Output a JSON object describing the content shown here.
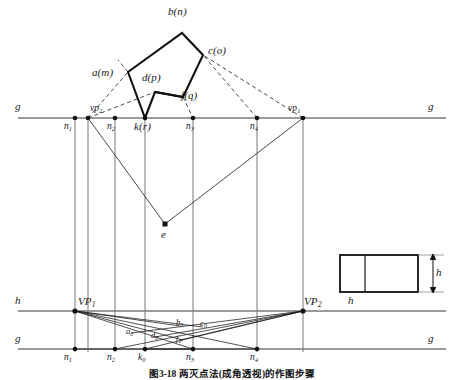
{
  "figure": {
    "type": "two-point-perspective-construction",
    "caption": "图3-18  两灭点法(成角透视)的作图步骤",
    "colors": {
      "stroke": "#1a1a1a",
      "light_stroke": "#6e6e6e",
      "background": "#ffffff"
    }
  },
  "plan_view": {
    "title_labels": {
      "ground_line_left": "g",
      "ground_line_right": "g"
    },
    "shape_vertices": [
      {
        "id": "a",
        "label": "a(m)",
        "x": 128,
        "y": 72
      },
      {
        "id": "b",
        "label": "b(n)",
        "x": 182,
        "y": 33
      },
      {
        "id": "c",
        "label": "c(o)",
        "x": 203,
        "y": 55
      },
      {
        "id": "f",
        "label": "f(q)",
        "x": 183,
        "y": 97
      },
      {
        "id": "d",
        "label": "d(p)",
        "x": 155,
        "y": 92
      },
      {
        "id": "k",
        "label": "k(r)",
        "x": 145,
        "y": 118
      }
    ],
    "ground_points": [
      {
        "id": "n1",
        "label": "n",
        "sub": "1",
        "x": 75
      },
      {
        "id": "vp2",
        "label": "vp",
        "sub": "2",
        "x": 88
      },
      {
        "id": "n2",
        "label": "n",
        "sub": "2",
        "x": 115
      },
      {
        "id": "k",
        "label": "k(r)",
        "sub": "",
        "x": 145
      },
      {
        "id": "n3",
        "label": "n",
        "sub": "3",
        "x": 193
      },
      {
        "id": "n4",
        "label": "n",
        "sub": "4",
        "x": 257
      },
      {
        "id": "vp1",
        "label": "vp",
        "sub": "1",
        "x": 303
      }
    ],
    "eye_point": {
      "id": "e",
      "label": "e",
      "x": 165,
      "y": 224
    },
    "ground_line_y": 118
  },
  "perspective_view": {
    "horizon_label_left": "h",
    "horizon_label_right": "h",
    "ground_label_left": "g",
    "ground_label_right": "g",
    "horizon_y": 311,
    "ground_y": 349,
    "vanishing_points": [
      {
        "id": "VP1",
        "label": "VP",
        "sub": "1",
        "x": 75,
        "y": 311
      },
      {
        "id": "VP2",
        "label": "VP",
        "sub": "2",
        "x": 303,
        "y": 311
      }
    ],
    "ground_points": [
      {
        "id": "n1",
        "label": "n",
        "sub": "1",
        "x": 75
      },
      {
        "id": "n2",
        "label": "n",
        "sub": "2",
        "x": 115
      },
      {
        "id": "k0",
        "label": "k",
        "sub": "0",
        "x": 145
      },
      {
        "id": "n3",
        "label": "n",
        "sub": "3",
        "x": 193
      },
      {
        "id": "n4",
        "label": "n",
        "sub": "4",
        "x": 257
      }
    ],
    "projected_points": [
      {
        "id": "a0",
        "label": "a",
        "sub": "0",
        "x": 131,
        "y": 333
      },
      {
        "id": "d0",
        "label": "d",
        "sub": "0",
        "x": 155,
        "y": 337
      },
      {
        "id": "b0",
        "label": "b",
        "sub": "0",
        "x": 180,
        "y": 326
      },
      {
        "id": "c0",
        "label": "c",
        "sub": "0",
        "x": 203,
        "y": 327
      },
      {
        "id": "f0",
        "label": "f",
        "sub": "0",
        "x": 180,
        "y": 340
      }
    ]
  },
  "elevation_inset": {
    "height_label": "h",
    "rect": {
      "x": 340,
      "y": 255,
      "width": 78,
      "height": 37
    },
    "divider_x": 365
  }
}
